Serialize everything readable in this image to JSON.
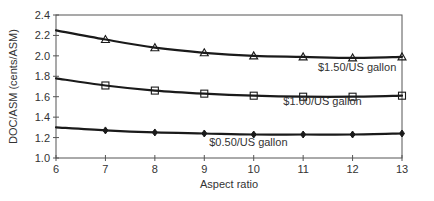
{
  "chart_data": {
    "type": "line",
    "title": "",
    "xlabel": "Aspect ratio",
    "ylabel": "DOC/ASM (cents/ASM)",
    "xlim": [
      6,
      13
    ],
    "ylim": [
      1.0,
      2.4
    ],
    "x_ticks": [
      "6",
      "7",
      "8",
      "9",
      "10",
      "11",
      "12",
      "13"
    ],
    "y_ticks": [
      "1.0",
      "1.2",
      "1.4",
      "1.6",
      "1.8",
      "2.0",
      "2.2",
      "2.4"
    ],
    "grid": false,
    "legend": "inline-labels",
    "x": [
      6,
      7,
      8,
      9,
      10,
      11,
      12,
      13
    ],
    "series": [
      {
        "name": "$1.50/US gallon",
        "marker": "triangle",
        "values": [
          2.25,
          2.16,
          2.08,
          2.03,
          2.0,
          1.99,
          1.98,
          1.99
        ]
      },
      {
        "name": "$1.00/US gallon",
        "marker": "square",
        "values": [
          1.78,
          1.71,
          1.66,
          1.63,
          1.61,
          1.6,
          1.6,
          1.61
        ]
      },
      {
        "name": "$0.50/US gallon",
        "marker": "diamond",
        "values": [
          1.3,
          1.27,
          1.25,
          1.24,
          1.23,
          1.23,
          1.23,
          1.24
        ]
      }
    ]
  }
}
